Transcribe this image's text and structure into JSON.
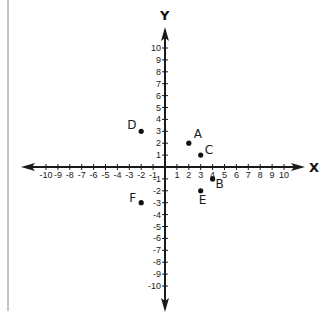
{
  "chart_data": {
    "type": "scatter",
    "title": "",
    "xlabel": "X",
    "ylabel": "Y",
    "xlim": [
      -10,
      10
    ],
    "ylim": [
      -10,
      10
    ],
    "grid": false,
    "x_ticks": [
      -10,
      -9,
      -8,
      -7,
      -6,
      -5,
      -4,
      -3,
      -2,
      -1,
      1,
      2,
      3,
      4,
      5,
      6,
      7,
      8,
      9,
      10
    ],
    "y_ticks": [
      -10,
      -9,
      -8,
      -7,
      -6,
      -5,
      -4,
      -3,
      -2,
      -1,
      1,
      2,
      3,
      4,
      5,
      6,
      7,
      8,
      9,
      10
    ],
    "points": [
      {
        "label": "A",
        "x": 2,
        "y": 2,
        "label_dx": 5,
        "label_dy": -5
      },
      {
        "label": "B",
        "x": 4,
        "y": -1,
        "label_dx": 3,
        "label_dy": 9
      },
      {
        "label": "C",
        "x": 3,
        "y": 1,
        "label_dx": 4,
        "label_dy": -1
      },
      {
        "label": "D",
        "x": -2,
        "y": 3,
        "label_dx": -14,
        "label_dy": -2
      },
      {
        "label": "E",
        "x": 3,
        "y": -2,
        "label_dx": -2,
        "label_dy": 13
      },
      {
        "label": "F",
        "x": -2,
        "y": -3,
        "label_dx": -12,
        "label_dy": -1
      }
    ]
  },
  "style": {
    "axis_color": "#1a1a1a",
    "point_color": "#111111",
    "border_color": "#8a8a8a",
    "background": "#ffffff"
  },
  "layout": {
    "origin_x": 165,
    "origin_y": 167,
    "unit_px": 11.9,
    "x_axis_left": 21,
    "x_axis_right": 305,
    "y_axis_top": 27,
    "y_axis_bottom": 312
  }
}
